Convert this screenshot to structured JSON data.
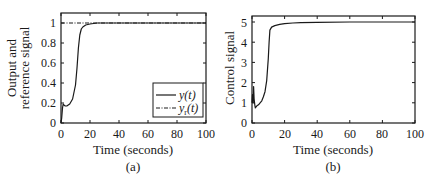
{
  "chart_data": [
    {
      "type": "line",
      "panel": "(a)",
      "title": "",
      "xlabel": "Time (seconds)",
      "ylabel": "Output and reference signal",
      "ylabel_lines": [
        "Output and",
        "reference signal"
      ],
      "xlim": [
        0,
        100
      ],
      "ylim": [
        0,
        1.1
      ],
      "xticks": [
        0,
        20,
        40,
        60,
        80,
        100
      ],
      "yticks": [
        0,
        0.2,
        0.4,
        0.6,
        0.8,
        1
      ],
      "ytick_labels": [
        "0",
        "0.2",
        "0.4",
        "0.6",
        "0.8",
        "1"
      ],
      "grid": false,
      "legend_position": "lower right",
      "series": [
        {
          "name": "y(t)",
          "style": "solid",
          "x": [
            0,
            0.5,
            1,
            1.5,
            2,
            3,
            4,
            6,
            8,
            10,
            11,
            12,
            13,
            14,
            15,
            17,
            20,
            25,
            30,
            40,
            60,
            80,
            100
          ],
          "y": [
            0,
            0.05,
            0.15,
            0.19,
            0.18,
            0.17,
            0.17,
            0.19,
            0.24,
            0.38,
            0.55,
            0.75,
            0.88,
            0.94,
            0.96,
            0.98,
            0.99,
            1.0,
            1.0,
            1.0,
            1.0,
            1.0,
            1.0
          ]
        },
        {
          "name": "y_r(t)",
          "style": "dash-dot",
          "x": [
            0,
            100
          ],
          "y": [
            1,
            1
          ]
        }
      ],
      "legend": [
        {
          "label_main": "y(t)",
          "label_sub": ""
        },
        {
          "label_main": "y",
          "label_sub": "r",
          "label_tail": "(t)"
        }
      ]
    },
    {
      "type": "line",
      "panel": "(b)",
      "title": "",
      "xlabel": "Time (seconds)",
      "ylabel": "Control signal",
      "xlim": [
        0,
        100
      ],
      "ylim": [
        0,
        5.3
      ],
      "xticks": [
        0,
        20,
        40,
        60,
        80,
        100
      ],
      "yticks": [
        0,
        1,
        2,
        3,
        4,
        5
      ],
      "ytick_labels": [
        "0",
        "1",
        "2",
        "3",
        "4",
        "5"
      ],
      "grid": false,
      "series": [
        {
          "name": "u(t)",
          "style": "solid",
          "x": [
            0,
            0.3,
            0.7,
            1,
            1.3,
            1.7,
            2,
            2.5,
            3,
            4,
            5,
            6,
            7,
            8,
            9,
            10,
            10.5,
            11,
            12,
            14,
            17,
            20,
            25,
            30,
            40,
            60,
            80,
            100
          ],
          "y": [
            1.0,
            1.4,
            1.0,
            1.8,
            1.2,
            0.9,
            0.75,
            0.8,
            0.85,
            0.9,
            1.0,
            1.1,
            1.3,
            1.55,
            2.1,
            3.2,
            4.0,
            4.6,
            4.75,
            4.82,
            4.88,
            4.92,
            4.95,
            4.97,
            4.98,
            5.0,
            5.0,
            5.0
          ]
        }
      ]
    }
  ],
  "captions": {
    "a": "(a)",
    "b": "(b)"
  },
  "axes": {
    "a": {
      "xlabel": "Time (seconds)",
      "ylabel_line1": "Output and",
      "ylabel_line2": "reference signal"
    },
    "b": {
      "xlabel": "Time (seconds)",
      "ylabel": "Control signal"
    }
  },
  "ticks": {
    "x": [
      "0",
      "20",
      "40",
      "60",
      "80",
      "100"
    ],
    "a_y": [
      "0",
      "0.2",
      "0.4",
      "0.6",
      "0.8",
      "1"
    ],
    "b_y": [
      "0",
      "1",
      "2",
      "3",
      "4",
      "5"
    ]
  },
  "legend": {
    "y_label": "y(t)",
    "yr_main": "y",
    "yr_sub": "r",
    "yr_tail": "(t)"
  }
}
